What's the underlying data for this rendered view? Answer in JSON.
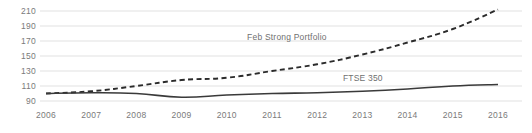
{
  "chart_data": {
    "type": "line",
    "title": "",
    "subtitle": "",
    "xlabel": "",
    "ylabel": "",
    "x": [
      2006,
      2007,
      2008,
      2009,
      2010,
      2011,
      2012,
      2013,
      2014,
      2015,
      2016
    ],
    "categories": [
      "2006",
      "2007",
      "2008",
      "2009",
      "2010",
      "2011",
      "2012",
      "2013",
      "2014",
      "2015",
      "2016"
    ],
    "xlim": [
      2006,
      2016
    ],
    "ylim": [
      90,
      210
    ],
    "yticks": [
      210,
      190,
      170,
      150,
      130,
      110,
      90
    ],
    "ytick_labels": [
      "210",
      "190",
      "170",
      "150",
      "130",
      "110",
      "90"
    ],
    "grid": true,
    "grid_axis": "y",
    "legend": "inline-annotations",
    "series": [
      {
        "name": "Feb Strong Portfolio",
        "style": "dashed",
        "color": "#2b2b2b",
        "values": [
          100,
          103,
          110,
          118,
          121,
          130,
          139,
          152,
          168,
          186,
          212
        ],
        "label_x": 2011.6,
        "label_y": 176
      },
      {
        "name": "FTSE 350",
        "style": "solid",
        "color": "#3a3a3a",
        "values": [
          100,
          101,
          100,
          95,
          98,
          100,
          101,
          103,
          106,
          110,
          112
        ],
        "label_x": 2013.1,
        "label_y": 121
      }
    ],
    "annotations": [
      {
        "text": "Feb Strong Portfolio"
      },
      {
        "text": "FTSE 350"
      }
    ],
    "colors": {
      "grid": "#d9d9d9",
      "tick_text": "#7a7a7a",
      "portfolio_line": "#2b2b2b",
      "ftse_line": "#3a3a3a",
      "background": "#ffffff"
    }
  }
}
